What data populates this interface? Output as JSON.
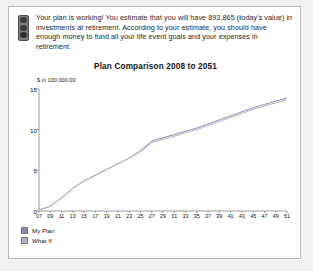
{
  "message": {
    "icon": "traffic-light-icon",
    "text": "Your plan is working! You estimate that you will have 893,865 (today's value) in investments at retirement. According to your estimate, you should have enough money to fund all your life event goals and your expenses in retirement."
  },
  "legend": [
    {
      "label": "My Plan",
      "color": "#8a8ab0"
    },
    {
      "label": "What If",
      "color": "#b0b0c8"
    }
  ],
  "chart_data": {
    "type": "line",
    "title": "Plan Comparison 2008 to 2051",
    "xlabel": "",
    "ylabel": "$ in 100,000.00",
    "grid": false,
    "legend_position": "bottom-left",
    "ylim": [
      0,
      15
    ],
    "yticks": [
      0,
      5,
      10,
      15
    ],
    "ytick_labels": [
      "0",
      "5",
      "10",
      "15"
    ],
    "categories": [
      "07",
      "09",
      "11",
      "13",
      "15",
      "17",
      "19",
      "21",
      "23",
      "25",
      "27",
      "29",
      "31",
      "33",
      "35",
      "37",
      "39",
      "41",
      "43",
      "45",
      "47",
      "49",
      "51"
    ],
    "xtick_labels": [
      "07",
      "09",
      "11",
      "13",
      "15",
      "17",
      "19",
      "21",
      "23",
      "25",
      "27",
      "29",
      "31",
      "33",
      "35",
      "37",
      "39",
      "41",
      "43",
      "45",
      "47",
      "49",
      "51"
    ],
    "series": [
      {
        "name": "My Plan",
        "color": "#8a8ab0",
        "values": [
          0.1,
          0.6,
          1.6,
          2.8,
          3.7,
          4.4,
          5.1,
          5.8,
          6.5,
          7.4,
          8.6,
          9.0,
          9.4,
          9.8,
          10.2,
          10.7,
          11.2,
          11.7,
          12.2,
          12.7,
          13.1,
          13.5,
          13.9
        ]
      },
      {
        "name": "What If",
        "color": "#b0b0c8",
        "values": [
          0.1,
          0.6,
          1.6,
          2.8,
          3.7,
          4.4,
          5.1,
          5.8,
          6.5,
          7.3,
          8.4,
          8.8,
          9.2,
          9.6,
          10.0,
          10.5,
          11.0,
          11.5,
          12.0,
          12.5,
          12.9,
          13.3,
          13.7
        ]
      }
    ]
  }
}
